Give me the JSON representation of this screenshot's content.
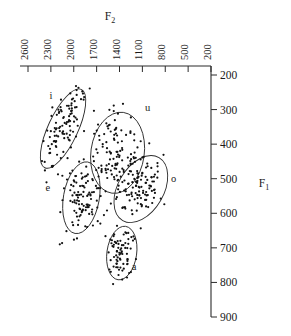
{
  "figure": {
    "background_color": "#ffffff",
    "ink_color": "#1a1a1a"
  },
  "chart_data": {
    "type": "scatter",
    "title": "",
    "xlabel": "F2",
    "xlabel_base": "F",
    "xlabel_sub": "2",
    "ylabel": "F1",
    "ylabel_base": "F",
    "ylabel_sub": "1",
    "x_axis_position": "top",
    "y_axis_position": "right",
    "x_direction": "descending",
    "y_direction": "descending",
    "xlim": [
      2600,
      200
    ],
    "ylim": [
      200,
      900
    ],
    "xticks": [
      2600,
      2300,
      2000,
      1700,
      1400,
      1100,
      800,
      500,
      200
    ],
    "yticks": [
      200,
      300,
      400,
      500,
      600,
      700,
      800,
      900
    ],
    "xtick_labels": [
      "2600",
      "2300",
      "2000",
      "1700",
      "1400",
      "1100",
      "800",
      "500",
      "200"
    ],
    "ytick_labels": [
      "200",
      "300",
      "400",
      "500",
      "600",
      "700",
      "800",
      "900"
    ],
    "xtick_label_rotation": -90,
    "grid": false,
    "legend": "none",
    "marker": "filled-circle",
    "marker_color": "#111111",
    "annotations": [
      {
        "label": "i",
        "x": 2300,
        "y": 270
      },
      {
        "label": "u",
        "x": 1030,
        "y": 305
      },
      {
        "label": "e",
        "x": 2340,
        "y": 535
      },
      {
        "label": "o",
        "x": 690,
        "y": 510
      },
      {
        "label": "a",
        "x": 1210,
        "y": 765
      }
    ],
    "clusters": [
      {
        "name": "i",
        "label": "i",
        "center_x": 2140,
        "center_y": 355,
        "ellipse_rx_units": 195,
        "ellipse_ry_units": 125,
        "ellipse_rotation_deg": 25,
        "n_points": 105
      },
      {
        "name": "u",
        "label": "u",
        "center_x": 1425,
        "center_y": 425,
        "ellipse_rx_units": 350,
        "ellipse_ry_units": 118,
        "ellipse_rotation_deg": 8,
        "n_points": 115
      },
      {
        "name": "e",
        "label": "e",
        "center_x": 1900,
        "center_y": 555,
        "ellipse_rx_units": 235,
        "ellipse_ry_units": 105,
        "ellipse_rotation_deg": 10,
        "n_points": 110
      },
      {
        "name": "o",
        "label": "o",
        "center_x": 1120,
        "center_y": 530,
        "ellipse_rx_units": 300,
        "ellipse_ry_units": 105,
        "ellipse_rotation_deg": 30,
        "n_points": 105
      },
      {
        "name": "a",
        "label": "a",
        "center_x": 1370,
        "center_y": 715,
        "ellipse_rx_units": 195,
        "ellipse_ry_units": 78,
        "ellipse_rotation_deg": 8,
        "n_points": 75
      }
    ]
  }
}
